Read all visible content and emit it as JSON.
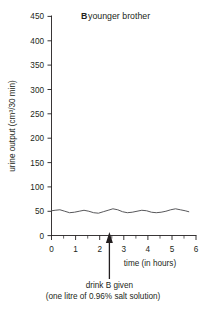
{
  "chart_data": {
    "type": "line",
    "title": "B younger brother",
    "title_bold_prefix": "B",
    "title_rest": " younger brother",
    "xlabel": "time (in hours)",
    "ylabel": "urine output (cm³/30 min)",
    "xlim": [
      0,
      6
    ],
    "ylim": [
      0,
      450
    ],
    "x_ticks": [
      0,
      1,
      2,
      3,
      4,
      5,
      6
    ],
    "x_tick_labels": [
      "0",
      "1",
      "2",
      "3",
      "4",
      "5",
      "6"
    ],
    "x_minor_step": 0.5,
    "y_ticks": [
      0,
      50,
      100,
      150,
      200,
      250,
      300,
      350,
      400,
      450
    ],
    "y_tick_labels": [
      "0",
      "50",
      "100",
      "150",
      "200",
      "250",
      "300",
      "350",
      "400",
      "450"
    ],
    "grid": false,
    "legend": "none",
    "series": [
      {
        "name": "urine output",
        "color": "#58585b",
        "x": [
          0.0,
          0.15,
          0.35,
          0.55,
          0.75,
          0.95,
          1.15,
          1.35,
          1.55,
          1.75,
          1.95,
          2.15,
          2.35,
          2.55,
          2.75,
          2.95,
          3.15,
          3.35,
          3.55,
          3.75,
          3.95,
          4.15,
          4.35,
          4.55,
          4.75,
          4.95,
          5.15,
          5.35,
          5.55,
          5.7
        ],
        "y": [
          51,
          52,
          53,
          50,
          47,
          48,
          50,
          52,
          50,
          47,
          46,
          49,
          52,
          55,
          53,
          49,
          47,
          48,
          50,
          52,
          51,
          48,
          47,
          48,
          50,
          53,
          55,
          53,
          51,
          49
        ]
      }
    ],
    "annotations": [
      {
        "type": "arrow",
        "x": 2.4,
        "label_line1": "drink B given",
        "label_line2": "(one litre of 0.96% salt solution)"
      }
    ]
  },
  "annotation": {
    "line1": "drink B given",
    "line2": "(one litre of 0.96% salt solution)"
  }
}
